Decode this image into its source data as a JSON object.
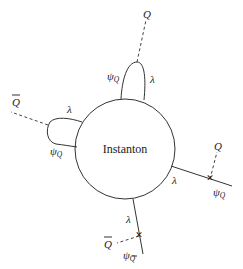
{
  "diagram": {
    "type": "feynman-instanton-diagram",
    "center_label": "Instanton",
    "labels": {
      "top_Q": "Q",
      "top_psi": "ψ",
      "top_psi_sub": "Q",
      "top_lambda": "λ",
      "left_Qbar": "Q",
      "left_lambda": "λ",
      "left_psi": "ψ",
      "left_psi_sub": "Q",
      "right_Q": "Q",
      "right_lambda": "λ",
      "right_psi": "ψ",
      "right_psi_sub": "Q",
      "bottom_lambda": "λ",
      "bottom_Qbar": "Q",
      "bottom_psi": "ψ",
      "bottom_psi_sub": "Q"
    },
    "vertex_marker": "✕"
  }
}
